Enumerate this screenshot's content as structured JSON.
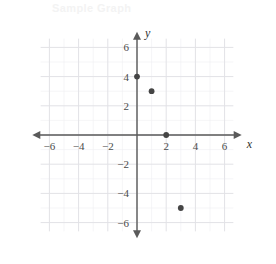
{
  "chart_data": {
    "type": "scatter",
    "title": "",
    "xlabel": "x",
    "ylabel": "y",
    "xlim": [
      -7,
      7
    ],
    "ylim": [
      -7,
      7
    ],
    "grid": true,
    "grid_major_step": 2,
    "grid_minor_step": 1,
    "legend": "none",
    "x_tick_labels": [
      "-6",
      "-4",
      "-2",
      "2",
      "4",
      "6"
    ],
    "x_tick_values": [
      -6,
      -4,
      -2,
      2,
      4,
      6
    ],
    "y_tick_labels": [
      "6",
      "4",
      "2",
      "-2",
      "-4",
      "-6"
    ],
    "y_tick_values": [
      6,
      4,
      2,
      -2,
      -4,
      -6
    ],
    "points": [
      {
        "x": 0,
        "y": 4
      },
      {
        "x": 1,
        "y": 3
      },
      {
        "x": 2,
        "y": 0
      },
      {
        "x": 3,
        "y": -5
      }
    ],
    "point_color": "#454545",
    "axis_color": "#5a5a5a",
    "grid_major_color": "#e2e2e6",
    "grid_minor_color": "#eeeef1"
  },
  "watermark": {
    "text": "Sample Graph"
  }
}
